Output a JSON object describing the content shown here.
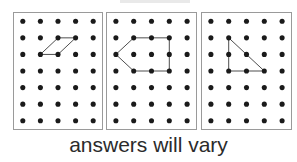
{
  "worksheet": {
    "caption": "answers will vary",
    "panel_count": 3,
    "grid": {
      "columns": 5,
      "rows": 7,
      "dot_color": "#1a1a1a",
      "dot_radius": 2.6
    },
    "panel_border_color": "#9a9a9a",
    "shape_stroke_color": "#4a4a4a",
    "background_color": "#ffffff",
    "panels": [
      {
        "label": "panel-1",
        "shape_name": "parallelogram",
        "vertex_count": 4,
        "vertices": [
          {
            "col": 1,
            "row": 2
          },
          {
            "col": 2,
            "row": 1
          },
          {
            "col": 3,
            "row": 1
          },
          {
            "col": 2,
            "row": 2
          }
        ]
      },
      {
        "label": "panel-2",
        "shape_name": "left-pointing-arrow-pentagon",
        "vertex_count": 5,
        "vertices": [
          {
            "col": 0,
            "row": 2
          },
          {
            "col": 1,
            "row": 1
          },
          {
            "col": 3,
            "row": 1
          },
          {
            "col": 3,
            "row": 3
          },
          {
            "col": 1,
            "row": 3
          }
        ]
      },
      {
        "label": "panel-3",
        "shape_name": "right-triangle",
        "vertex_count": 3,
        "vertices": [
          {
            "col": 1,
            "row": 1
          },
          {
            "col": 1,
            "row": 3
          },
          {
            "col": 3,
            "row": 3
          }
        ]
      }
    ]
  }
}
